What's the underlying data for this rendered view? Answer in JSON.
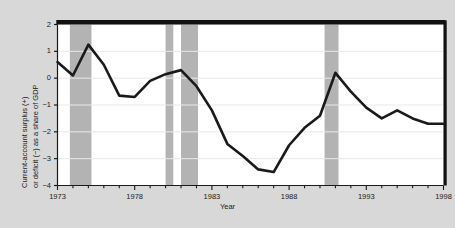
{
  "chart_data": {
    "type": "line",
    "title": "",
    "xlabel": "Year",
    "ylabel": "Current-account surplus (+) or deficit (−) as a share of GDP",
    "ylabel_line1": "Current-account surplus (+)",
    "ylabel_line2": "or deficit (−) as a share of GDP",
    "xlim": [
      1973,
      1998
    ],
    "ylim": [
      -4,
      2
    ],
    "yticks": [
      2,
      1,
      0,
      -1,
      -2,
      -3,
      -4
    ],
    "ytick_labels": [
      "2",
      "1",
      "0",
      "−1",
      "−2",
      "−3",
      "−4"
    ],
    "xticks": [
      1973,
      1978,
      1983,
      1988,
      1993,
      1998
    ],
    "xtick_labels": [
      "1973",
      "1978",
      "1983",
      "1988",
      "1993",
      "1998"
    ],
    "xtick_minor_step": 1,
    "grid": "horizontal",
    "grid_color": "#e9e9e9",
    "line_color": "#1a1a1a",
    "line_width": 2.6,
    "plot_background": "#ffffff",
    "figure_background": "#d8d8d8",
    "legend": "none",
    "series": [
      {
        "name": "Current-account balance as a share of GDP",
        "x": [
          1973,
          1974,
          1975,
          1976,
          1977,
          1978,
          1979,
          1980,
          1981,
          1982,
          1983,
          1984,
          1985,
          1986,
          1987,
          1988,
          1989,
          1990,
          1991,
          1992,
          1993,
          1994,
          1995,
          1996,
          1997,
          1998
        ],
        "values": [
          0.6,
          0.1,
          1.25,
          0.5,
          -0.65,
          -0.7,
          -0.1,
          0.15,
          0.3,
          -0.3,
          -1.2,
          -2.45,
          -2.9,
          -3.4,
          -3.5,
          -2.5,
          -1.85,
          -1.4,
          0.2,
          -0.5,
          -1.1,
          -1.5,
          -1.2,
          -1.5,
          -1.7,
          -1.7
        ]
      }
    ],
    "shaded_bands": [
      {
        "name": "recession-band-1973-1975",
        "start": 1973.8,
        "end": 1975.2
      },
      {
        "name": "recession-band-1980",
        "start": 1980.0,
        "end": 1980.5
      },
      {
        "name": "recession-band-1981-1982",
        "start": 1981.0,
        "end": 1982.1
      },
      {
        "name": "recession-band-1990-1991",
        "start": 1990.3,
        "end": 1991.2
      }
    ],
    "band_color": "#b3b3b3",
    "band_label": "recession"
  }
}
